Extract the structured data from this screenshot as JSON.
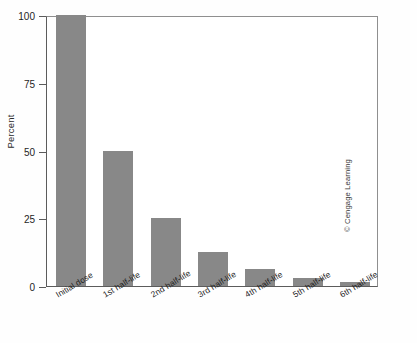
{
  "chart_data": {
    "type": "bar",
    "title": "",
    "subtitle": "",
    "xlabel": "",
    "ylabel": "Percent",
    "categories": [
      "Initial dose",
      "1st half-life",
      "2nd half-life",
      "3rd half-life",
      "4th half-life",
      "5th half-life",
      "6th half-life"
    ],
    "values": [
      100,
      50,
      25,
      12.5,
      6.25,
      3.125,
      1.5625
    ],
    "ylim": [
      0,
      100
    ],
    "yticks": [
      0,
      25,
      50,
      75,
      100
    ],
    "ytick_labels": [
      "0",
      "25",
      "50",
      "75",
      "100"
    ],
    "grid": false,
    "legend": null,
    "bar_color": "#888888",
    "axis_color": "#5c5c5c",
    "background_color": "#ffffff"
  },
  "credit": {
    "text": "© Cengage Learning"
  }
}
